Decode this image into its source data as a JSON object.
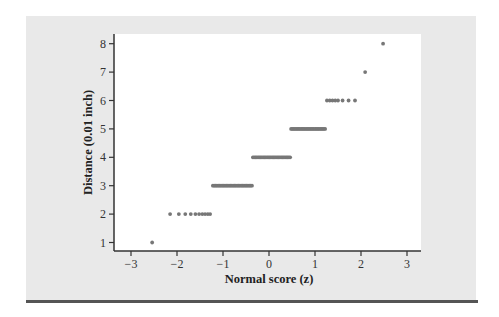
{
  "chart_data": {
    "type": "scatter",
    "title": "",
    "xlabel": "Normal score (z)",
    "ylabel": "Distance (0.01 inch)",
    "xlim": [
      -3.3,
      3.3
    ],
    "ylim": [
      0.7,
      8.3
    ],
    "xticks": [
      -3,
      -2,
      -1,
      0,
      1,
      2,
      3
    ],
    "xtick_labels": [
      "−3",
      "−2",
      "−1",
      "0",
      "1",
      "2",
      "3"
    ],
    "yticks": [
      1,
      2,
      3,
      4,
      5,
      6,
      7,
      8
    ],
    "ytick_labels": [
      "1",
      "2",
      "3",
      "4",
      "5",
      "6",
      "7",
      "8"
    ],
    "grid": false,
    "legend": null,
    "marker_color": "#777777",
    "groups": [
      {
        "y": 1,
        "x": [
          -2.54
        ]
      },
      {
        "y": 2,
        "x": [
          -2.15,
          -1.96,
          -1.82,
          -1.7,
          -1.6,
          -1.52,
          -1.45,
          -1.39,
          -1.33,
          -1.28
        ]
      },
      {
        "y": 3,
        "x_range": [
          -1.22,
          -0.37
        ],
        "count": 30
      },
      {
        "y": 4,
        "x_range": [
          -0.35,
          0.46
        ],
        "count": 30
      },
      {
        "y": 5,
        "x_range": [
          0.48,
          1.22
        ],
        "count": 28
      },
      {
        "y": 6,
        "x": [
          1.26,
          1.32,
          1.38,
          1.44,
          1.5,
          1.6,
          1.73,
          1.87
        ]
      },
      {
        "y": 7,
        "x": [
          2.09
        ]
      },
      {
        "y": 8,
        "x": [
          2.48
        ]
      }
    ]
  },
  "colors": {
    "panel_background": "#e9e9e9",
    "plot_background": "#ffffff",
    "axis": "#333333",
    "bottom_rule": "#555555"
  }
}
